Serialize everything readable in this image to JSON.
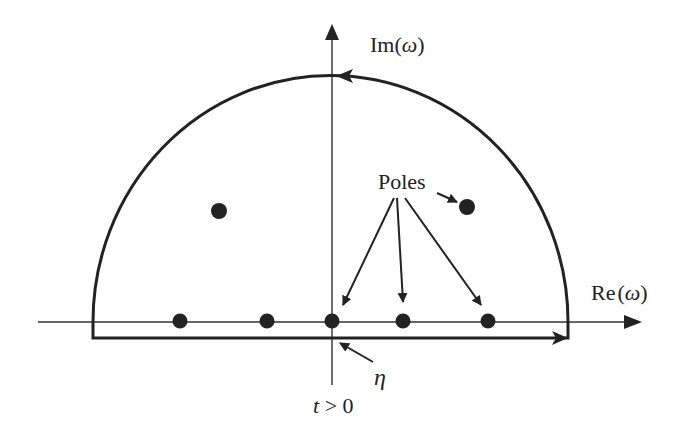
{
  "diagram": {
    "type": "contour-integral",
    "colors": {
      "stroke": "#222222",
      "background": "#ffffff"
    },
    "axes": {
      "imaginary_label_prefix": "Im(",
      "imaginary_label_var": "ω",
      "imaginary_label_suffix": ")",
      "real_label_prefix": "Re",
      "real_label_open": "(",
      "real_label_var": "ω",
      "real_label_close": ")"
    },
    "labels": {
      "poles": "Poles",
      "eta": "η",
      "condition": "t > 0"
    },
    "poles": {
      "on_real_axis": 5,
      "upper_half_plane": 2
    }
  }
}
